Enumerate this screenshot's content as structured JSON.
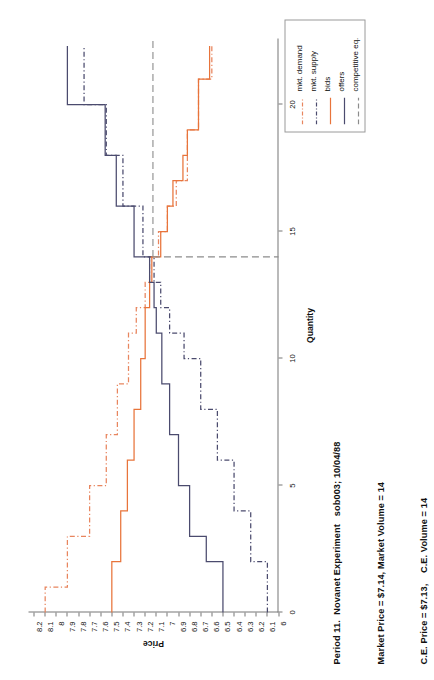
{
  "title": {
    "line1": "Period 11.  Novanet Experiment   sob003; 10/04/88",
    "line2": "Market Price = $7.14, Market Volume = 14",
    "line3": "C.E. Price = $7.13,    C.E. Volume = 14"
  },
  "legend": {
    "position": "top-right",
    "items": [
      {
        "label": "mkt. demand",
        "color": "#E8855E",
        "style": "dashdot"
      },
      {
        "label": "mkt. supply",
        "color": "#4B4B6E",
        "style": "dashdot"
      },
      {
        "label": "bids",
        "color": "#E8743B",
        "style": "solid"
      },
      {
        "label": "offers",
        "color": "#4B4B6E",
        "style": "solid"
      },
      {
        "label": "competitive eq.",
        "color": "#8C8C8C",
        "style": "dashed"
      }
    ]
  },
  "chart_data": {
    "type": "line",
    "title": "Period 11.  Novanet Experiment   sob003; 10/04/88",
    "xlabel": "Quantity",
    "ylabel": "Price",
    "xlim": [
      0,
      22.6
    ],
    "ylim": [
      6.0,
      8.25
    ],
    "grid": false,
    "xticks": [
      0,
      5,
      10,
      15,
      20
    ],
    "yticks": [
      6,
      6.1,
      6.2,
      6.3,
      6.4,
      6.5,
      6.6,
      6.7,
      6.8,
      6.9,
      7,
      7.1,
      7.2,
      7.3,
      7.4,
      7.5,
      7.6,
      7.7,
      7.8,
      7.9,
      8,
      8.1,
      8.2
    ],
    "ytick_labels": [
      "6",
      "6.1",
      "6.2",
      "6.3",
      "6.4",
      "6.5",
      "6.6",
      "6.7",
      "6.8",
      "6.9",
      "7",
      "7.1",
      "7.2",
      "7.3",
      "7.4",
      "7.5",
      "7.6",
      "7.7",
      "7.8",
      "7.9",
      "8",
      "8.1",
      "8.2"
    ],
    "market_price": 7.14,
    "market_volume": 14,
    "ce_price": 7.13,
    "ce_volume": 14,
    "series": [
      {
        "name": "mkt. demand",
        "color": "#E8855E",
        "style": "dashdot",
        "step": "post",
        "x": [
          0,
          1,
          1,
          3,
          3,
          5,
          5,
          7,
          7,
          9,
          9,
          11,
          11,
          12,
          12,
          13,
          13,
          14,
          14,
          15,
          15,
          16,
          16,
          17,
          17,
          19,
          19,
          21,
          21,
          22.3
        ],
        "y": [
          8.1,
          8.1,
          7.9,
          7.9,
          7.7,
          7.7,
          7.55,
          7.55,
          7.45,
          7.45,
          7.35,
          7.35,
          7.28,
          7.28,
          7.2,
          7.2,
          7.16,
          7.16,
          7.08,
          7.08,
          7.0,
          7.0,
          6.92,
          6.92,
          6.82,
          6.82,
          6.72,
          6.72,
          6.6,
          6.6
        ]
      },
      {
        "name": "mkt. supply",
        "color": "#4B4B6E",
        "style": "dashdot",
        "step": "post",
        "x": [
          0,
          2,
          2,
          4,
          4,
          6,
          6,
          8,
          8,
          10,
          10,
          11,
          11,
          12,
          12,
          13,
          13,
          14,
          14,
          16,
          16,
          18,
          18,
          20,
          20,
          22.3
        ],
        "y": [
          6.1,
          6.1,
          6.25,
          6.25,
          6.4,
          6.4,
          6.55,
          6.55,
          6.7,
          6.7,
          6.85,
          6.85,
          6.98,
          6.98,
          7.06,
          7.06,
          7.12,
          7.12,
          7.22,
          7.22,
          7.4,
          7.4,
          7.55,
          7.55,
          7.75,
          7.75
        ]
      },
      {
        "name": "bids",
        "color": "#E8743B",
        "style": "solid",
        "step": "post",
        "x": [
          0,
          2,
          2,
          4,
          4,
          6,
          6,
          8,
          8,
          10,
          10,
          12,
          12,
          13,
          13,
          14,
          14,
          15,
          15,
          16,
          16,
          17,
          17,
          18,
          18,
          19,
          19,
          21,
          21,
          22.3
        ],
        "y": [
          7.5,
          7.5,
          7.42,
          7.42,
          7.36,
          7.36,
          7.3,
          7.3,
          7.24,
          7.24,
          7.2,
          7.2,
          7.16,
          7.16,
          7.14,
          7.14,
          7.06,
          7.06,
          7.0,
          7.0,
          6.95,
          6.95,
          6.86,
          6.86,
          6.82,
          6.82,
          6.72,
          6.72,
          6.62,
          6.62
        ]
      },
      {
        "name": "offers",
        "color": "#4B4B6E",
        "style": "solid",
        "step": "post",
        "x": [
          0,
          2,
          2,
          3,
          3,
          5,
          5,
          7,
          7,
          9,
          9,
          11,
          11,
          12,
          12,
          13,
          13,
          14,
          14,
          16,
          16,
          18,
          18,
          20,
          20,
          22.3
        ],
        "y": [
          6.5,
          6.5,
          6.65,
          6.65,
          6.8,
          6.8,
          6.9,
          6.9,
          6.98,
          6.98,
          7.05,
          7.05,
          7.1,
          7.1,
          7.12,
          7.12,
          7.16,
          7.16,
          7.3,
          7.3,
          7.46,
          7.46,
          7.56,
          7.56,
          7.9,
          7.9
        ]
      }
    ],
    "ce_lines": {
      "color": "#8C8C8C",
      "style": "dashed",
      "horizontal_quantity": 14,
      "vertical_price": 7.13
    }
  },
  "axes": {
    "x_title": "Quantity",
    "y_title": "Price"
  }
}
